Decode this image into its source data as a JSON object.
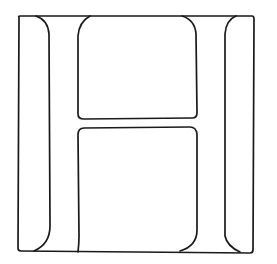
{
  "figure": {
    "letter": "H",
    "stroke_color": "#1a1a1a",
    "background_color": "#ffffff"
  }
}
